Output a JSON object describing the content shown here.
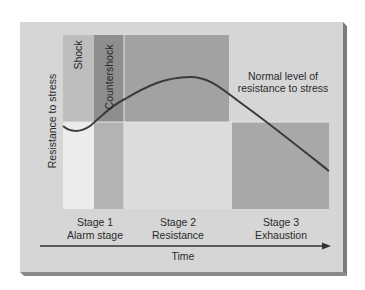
{
  "diagram": {
    "y_axis_label": "Resistance to stress",
    "x_axis_label": "Time",
    "phase_labels": {
      "shock": "Shock",
      "countershock": "Countershock"
    },
    "annotation": {
      "line1": "Normal level of",
      "line2": "resistance to stress"
    },
    "stages": [
      {
        "number": "Stage 1",
        "name": "Alarm stage"
      },
      {
        "number": "Stage 2",
        "name": "Resistance"
      },
      {
        "number": "Stage 3",
        "name": "Exhaustion"
      }
    ],
    "colors": {
      "panel": "#d6d6d6",
      "panel_bevel": "#8a8a8a",
      "shock_upper": "#bdbdbd",
      "shock_lower": "#ececec",
      "countershock_upper": "#8e8e8e",
      "countershock_lower": "#b3b3b3",
      "stage2_upper": "#a2a2a2",
      "stage2_lower": "#dcdcdc",
      "stage3_box": "#a8a8a8",
      "curve": "#3a3a3a",
      "text": "#2a2a2a"
    }
  }
}
